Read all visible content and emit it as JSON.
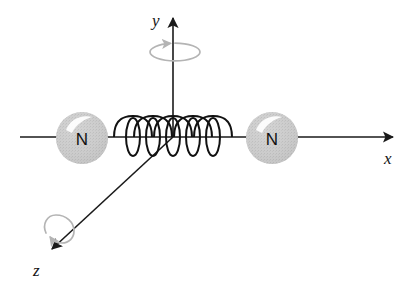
{
  "figure": {
    "background_color": "#ffffff",
    "width": 414,
    "height": 289
  },
  "axes": {
    "line_color": "#1a1a1a",
    "labels": {
      "x": "x",
      "y": "y",
      "z": "z"
    },
    "x_axis": {
      "name": "x-axis",
      "start": [
        20,
        137
      ],
      "end": [
        397,
        137
      ],
      "arrow_at_end": true,
      "label_pos": [
        386,
        162
      ]
    },
    "y_axis": {
      "name": "y-axis",
      "start": [
        173,
        137
      ],
      "end": [
        173,
        14
      ],
      "arrow_at_end": true,
      "label_pos": [
        152,
        24
      ]
    },
    "z_axis": {
      "name": "z-axis",
      "start": [
        173,
        137
      ],
      "end": [
        48,
        252
      ],
      "arrow_at_end": true,
      "label_pos": [
        34,
        274
      ]
    }
  },
  "atoms": [
    {
      "name": "left-nitrogen-atom",
      "label": "N",
      "cx": 82,
      "cy": 138,
      "r": 26,
      "fill_color": "#c6c6c6",
      "highlight_color": "#ffffff"
    },
    {
      "name": "right-nitrogen-atom",
      "label": "N",
      "cx": 272,
      "cy": 138,
      "r": 26,
      "fill_color": "#c6c6c6",
      "highlight_color": "#ffffff"
    }
  ],
  "spring": {
    "name": "spring-coil",
    "stroke_color": "#111111",
    "x_start": 114,
    "x_end": 232,
    "loops": 5,
    "arch_height": 21,
    "ellipse_rx": 7,
    "ellipse_ry": 19
  },
  "rotation_arrows": [
    {
      "name": "y-axis-rotation-arrow",
      "cx": 175,
      "cy": 52,
      "rx": 25,
      "ry": 9,
      "color": "#b4b4b4"
    },
    {
      "name": "z-axis-rotation-arrow",
      "cx": 57,
      "cy": 228,
      "rx": 17,
      "ry": 11,
      "color": "#b4b4b4"
    }
  ],
  "colors": {
    "ink": "#1a1a1a",
    "sphere_gray": "#c6c6c6",
    "rotation_gray": "#b4b4b4",
    "background": "#ffffff"
  }
}
